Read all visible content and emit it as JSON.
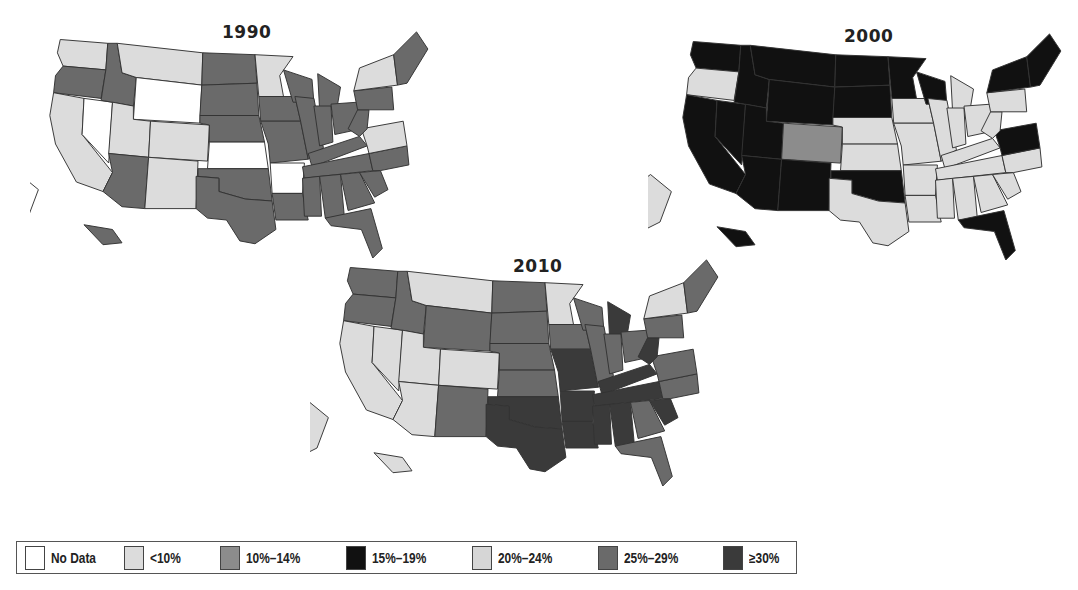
{
  "chart_data": {
    "type": "choropleth",
    "title": "",
    "maps": [
      {
        "year": "1990",
        "fills": {
          "WA": "lt",
          "OR": "mid",
          "CA": "lt",
          "NV": "nd",
          "ID": "mid",
          "MT": "lt",
          "WY": "nd",
          "UT": "lt",
          "CO": "lt",
          "AZ": "mid",
          "NM": "lt",
          "ND": "mid",
          "SD": "mid",
          "NE": "mid",
          "KS": "nd",
          "OK": "mid",
          "TX": "mid",
          "MN": "lt",
          "IA": "mid",
          "MO": "mid",
          "AR": "nd",
          "LA": "mid",
          "WI": "mid",
          "IL": "mid",
          "MI": "mid",
          "IN": "mid",
          "OH": "mid",
          "KY": "mid",
          "TN": "mid",
          "MS": "mid",
          "AL": "mid",
          "GA": "mid",
          "FL": "mid",
          "SC": "mid",
          "NC": "mid",
          "VA": "lt",
          "WV": "mid",
          "PA": "mid",
          "NY": "lt",
          "NE_REG": "mid",
          "AK": "nd",
          "HI": "mid"
        }
      },
      {
        "year": "2000",
        "fills": {
          "WA": "blk",
          "OR": "lt",
          "CA": "blk",
          "NV": "blk",
          "ID": "blk",
          "MT": "blk",
          "WY": "blk",
          "UT": "blk",
          "CO": "gray",
          "AZ": "blk",
          "NM": "blk",
          "ND": "blk",
          "SD": "blk",
          "NE": "lt",
          "KS": "lt",
          "OK": "blk",
          "TX": "lt",
          "MN": "blk",
          "IA": "lt",
          "MO": "lt",
          "AR": "lt",
          "LA": "lt",
          "WI": "blk",
          "IL": "lt",
          "MI": "lt",
          "IN": "lt",
          "OH": "lt",
          "KY": "lt",
          "TN": "lt",
          "MS": "lt",
          "AL": "lt",
          "GA": "lt",
          "FL": "blk",
          "SC": "lt",
          "NC": "lt",
          "VA": "blk",
          "WV": "lt",
          "PA": "lt",
          "NY": "blk",
          "NE_REG": "blk",
          "AK": "lt",
          "HI": "blk"
        }
      },
      {
        "year": "2010",
        "fills": {
          "WA": "mid",
          "OR": "mid",
          "CA": "lt",
          "NV": "lt",
          "ID": "mid",
          "MT": "lt",
          "WY": "mid",
          "UT": "lt",
          "CO": "lt",
          "AZ": "lt",
          "NM": "mid",
          "ND": "mid",
          "SD": "mid",
          "NE": "mid",
          "KS": "mid",
          "OK": "dk",
          "TX": "dk",
          "MN": "lt",
          "IA": "mid",
          "MO": "dk",
          "AR": "dk",
          "LA": "dk",
          "WI": "mid",
          "IL": "mid",
          "MI": "dk",
          "IN": "mid",
          "OH": "mid",
          "KY": "dk",
          "TN": "dk",
          "MS": "dk",
          "AL": "dk",
          "GA": "mid",
          "FL": "mid",
          "SC": "dk",
          "NC": "mid",
          "VA": "mid",
          "WV": "dk",
          "PA": "mid",
          "NY": "lt",
          "NE_REG": "mid",
          "AK": "lt",
          "HI": "lt"
        }
      }
    ],
    "legend": [
      {
        "label": "No Data",
        "key": "nd",
        "color": "#ffffff"
      },
      {
        "label": "<10%",
        "key": "lt",
        "color": "#dcdcdc"
      },
      {
        "label": "10%–14%",
        "key": "gray",
        "color": "#8c8c8c"
      },
      {
        "label": "15%–19%",
        "key": "blk",
        "color": "#111111"
      },
      {
        "label": "20%–24%",
        "key": "lt2",
        "color": "#d6d6d6"
      },
      {
        "label": "25%–29%",
        "key": "mid",
        "color": "#6a6a6a"
      },
      {
        "label": "≥30%",
        "key": "dk",
        "color": "#3a3a3a"
      }
    ],
    "legend_position": "bottom"
  },
  "titles": {
    "m1990": "1990",
    "m2000": "2000",
    "m2010": "2010"
  },
  "legend_labels": [
    "No Data",
    "<10%",
    "10%–14%",
    "15%–19%",
    "20%–24%",
    "25%–29%",
    "≥30%"
  ]
}
